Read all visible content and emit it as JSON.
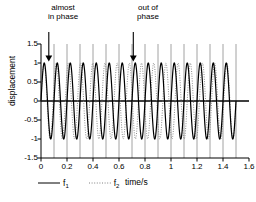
{
  "chart_data": {
    "type": "line",
    "title": "",
    "xlabel": "time/s",
    "ylabel": "displacement",
    "xlim": [
      0,
      1.6
    ],
    "ylim": [
      -1.5,
      1.5
    ],
    "xticks": [
      "0",
      "0.2",
      "0.4",
      "0.6",
      "0.8",
      "1",
      "1.2",
      "1.4",
      "1.6"
    ],
    "xtick_values": [
      0,
      0.2,
      0.4,
      0.6,
      0.8,
      1.0,
      1.2,
      1.4,
      1.6
    ],
    "yticks": [
      "1.5",
      "1",
      "0.5",
      "0",
      "-0.5",
      "-1",
      "-1.5"
    ],
    "ytick_values": [
      1.5,
      1.0,
      0.5,
      0.0,
      -0.5,
      -1.0,
      -1.5
    ],
    "grid": "vertical gridlines every 0.1 s",
    "gridline_values": [
      0.1,
      0.2,
      0.3,
      0.4,
      0.5,
      0.6,
      0.7,
      0.8,
      0.9,
      1.0,
      1.1,
      1.2,
      1.3,
      1.4,
      1.5
    ],
    "legend_position": "below-axes-left",
    "series": [
      {
        "name": "f1",
        "label": "f",
        "subscript": "1",
        "style": "solid",
        "color": "#000000",
        "amplitude": 1.0,
        "frequency_hz": 10,
        "phase": 0,
        "t_start": 0,
        "t_end": 1.5,
        "equation": "sin(2*pi*10*t)"
      },
      {
        "name": "f2",
        "label": "f",
        "subscript": "2",
        "style": "dotted",
        "color": "#808080",
        "amplitude": 1.0,
        "frequency_hz": 10.667,
        "phase": 0,
        "t_start": 0,
        "t_end": 1.5,
        "equation": "sin(2*pi*10.667*t)"
      }
    ],
    "annotations": [
      {
        "name": "almost-in-phase",
        "text": "almost\nin phase",
        "arrow_x": 0.06,
        "arrow_y_top": 1.45,
        "arrow_y_tip": 1.05
      },
      {
        "name": "out-of-phase",
        "text": "out of\nphase",
        "arrow_x": 0.71,
        "arrow_y_top": 1.45,
        "arrow_y_tip": 1.05
      }
    ],
    "colors": {
      "axis": "#000000",
      "grid": "#8c8c8c",
      "f1": "#000000",
      "f2": "#808080",
      "background": "#ffffff"
    }
  },
  "axes": {
    "ylabel_title": "displacement",
    "xlabel_title": "time/s"
  },
  "legend": {
    "entries": [
      {
        "label": "f",
        "sub": "1",
        "style": "solid"
      },
      {
        "label": "f",
        "sub": "2",
        "style": "dotted"
      }
    ]
  },
  "annotations": {
    "left": "almost\nin phase",
    "right": "out of\nphase"
  }
}
